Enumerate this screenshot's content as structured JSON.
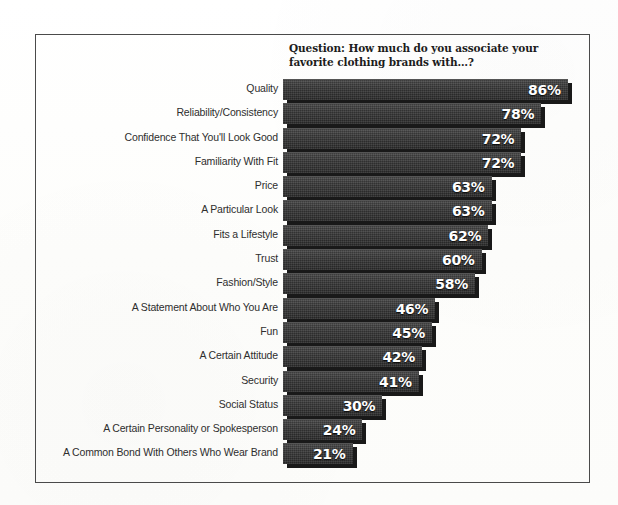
{
  "chart_data": {
    "type": "bar",
    "orientation": "horizontal",
    "title": "Question: How much do you associate your favorite clothing brands with…?",
    "xlabel": "",
    "ylabel": "",
    "xlim": [
      0,
      100
    ],
    "grid": false,
    "legend": false,
    "value_suffix": "%",
    "categories": [
      "Quality",
      "Reliability/Consistency",
      "Confidence That You'll Look Good",
      "Familiarity With Fit",
      "Price",
      "A Particular Look",
      "Fits a Lifestyle",
      "Trust",
      "Fashion/Style",
      "A Statement About Who You Are",
      "Fun",
      "A Certain Attitude",
      "Security",
      "Social Status",
      "A Certain Personality or Spokesperson",
      "A Common Bond With Others Who Wear Brand"
    ],
    "values": [
      86,
      78,
      72,
      72,
      63,
      63,
      62,
      60,
      58,
      46,
      45,
      42,
      41,
      30,
      24,
      21
    ],
    "value_labels": [
      "86%",
      "78%",
      "72%",
      "72%",
      "63%",
      "63%",
      "62%",
      "60%",
      "58%",
      "46%",
      "45%",
      "42%",
      "41%",
      "30%",
      "24%",
      "21%"
    ],
    "colors": {
      "bar": "#3c3c3c",
      "bar_shadow": "#191919",
      "value_text": "#ffffff",
      "category_text": "#2e2e2e",
      "frame": "#4a4a4a",
      "background": "#fdfdfc"
    }
  }
}
